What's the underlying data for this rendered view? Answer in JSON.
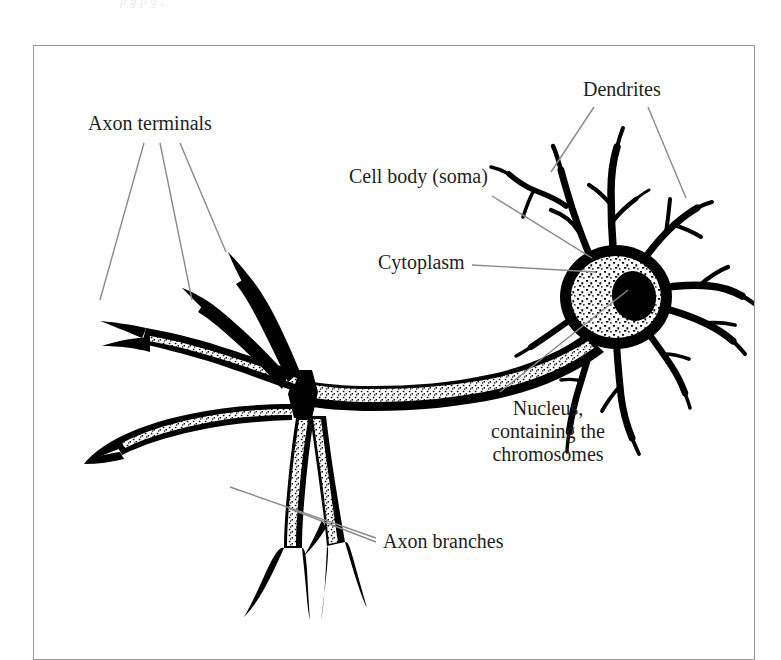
{
  "figure": {
    "kind": "biological-diagram",
    "scan_top_remnant": "p     g          p     g  ,",
    "frame": {
      "border_color": "#9a9a9a",
      "background_color": "#ffffff"
    },
    "ink_color": "#000000",
    "leader_line_color": "#8a8a8a",
    "text_color": "#231f20"
  },
  "labels": {
    "dendrites": "Dendrites",
    "axon_terminals": "Axon terminals",
    "cell_body": "Cell body (soma)",
    "cytoplasm": "Cytoplasm",
    "nucleus_line_1": "Nucleus,",
    "nucleus_line_2": "containing the",
    "nucleus_line_3": "chromosomes",
    "axon_branches": "Axon branches"
  },
  "parts": [
    {
      "name": "dendrites",
      "label": "Dendrites",
      "leader_count": 2
    },
    {
      "name": "cell-body",
      "label": "Cell body (soma)",
      "leader_count": 1
    },
    {
      "name": "cytoplasm",
      "label": "Cytoplasm",
      "leader_count": 1
    },
    {
      "name": "nucleus",
      "label": "Nucleus, containing the chromosomes",
      "leader_count": 1
    },
    {
      "name": "axon-terminals",
      "label": "Axon terminals",
      "leader_count": 3
    },
    {
      "name": "axon-branches",
      "label": "Axon branches",
      "leader_count": 2
    }
  ]
}
